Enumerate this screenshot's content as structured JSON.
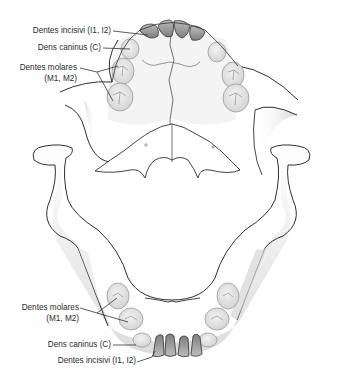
{
  "figure": {
    "upper_jaw": {
      "labels": [
        {
          "id": "incisors",
          "text": "Dentes incisivi (I1, I2)"
        },
        {
          "id": "canine",
          "text": "Dens caninus (C)"
        },
        {
          "id": "molars_line1",
          "text": "Dentes molares"
        },
        {
          "id": "molars_line2",
          "text": "(M1, M2)"
        }
      ]
    },
    "lower_jaw": {
      "labels": [
        {
          "id": "molars_line1",
          "text": "Dentes molares"
        },
        {
          "id": "molars_line2",
          "text": "(M1, M2)"
        },
        {
          "id": "canine",
          "text": "Dens caninus (C)"
        },
        {
          "id": "incisors",
          "text": "Dentes incisivi (I1, I2)"
        }
      ]
    },
    "colors": {
      "outline": "#2f2f2f",
      "bone_shade": "#d9d9d9",
      "tooth_fill": "#e2e2e2",
      "incisor_fill": "#9a9a9a",
      "leader_line": "#333333",
      "text": "#2b2b2b"
    }
  }
}
